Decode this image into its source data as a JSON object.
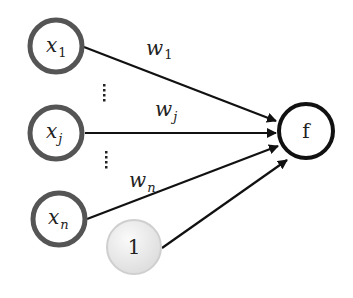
{
  "diagram": {
    "type": "perceptron",
    "inputs": [
      {
        "id": "x1",
        "base": "x",
        "sub": "1"
      },
      {
        "id": "xj",
        "base": "x",
        "sub": "j"
      },
      {
        "id": "xn",
        "base": "x",
        "sub": "n"
      }
    ],
    "bias": {
      "label": "1",
      "fill": "#e4e4e4"
    },
    "output": {
      "label": "f"
    },
    "weights": [
      {
        "id": "w1",
        "base": "w",
        "sub": "1"
      },
      {
        "id": "wj",
        "base": "w",
        "sub": "j"
      },
      {
        "id": "wn",
        "base": "w",
        "sub": "n"
      }
    ],
    "ellipsis": "⋮",
    "colors": {
      "input_stroke": "#555555",
      "output_stroke": "#111111",
      "edge": "#111111"
    }
  }
}
